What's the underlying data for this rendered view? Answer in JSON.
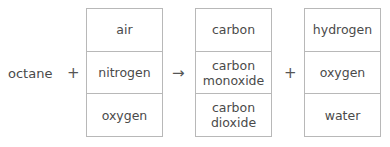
{
  "equation": {
    "reactant": "octane",
    "plus_1": "+",
    "arrow": "→",
    "plus_2": "+",
    "boxes": [
      {
        "items": [
          "air",
          "nitrogen",
          "oxygen"
        ]
      },
      {
        "items": [
          "carbon",
          "carbon\nmonoxide",
          "carbon\ndioxide"
        ]
      },
      {
        "items": [
          "hydrogen",
          "oxygen",
          "water"
        ]
      }
    ]
  }
}
